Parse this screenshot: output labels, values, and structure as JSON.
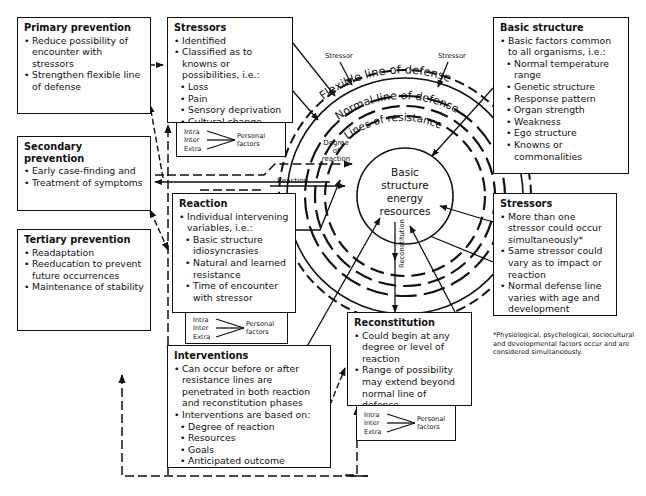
{
  "diagram": {
    "center": {
      "label_lines": [
        "Basic",
        "structure",
        "energy",
        "resources"
      ]
    },
    "rings": {
      "flexible": "Flexible line of defense",
      "normal": "Normal line of defense",
      "resistance": "Lines of resistance"
    },
    "labels": {
      "stressor_left": "Stressor",
      "stressor_right": "Stressor",
      "degree_of_reaction": [
        "Degree",
        "of",
        "reaction"
      ],
      "reaction": "Reaction",
      "reconstitution": "Reconstitution"
    }
  },
  "boxes": {
    "primary_prevention": {
      "title": "Primary prevention",
      "items": [
        "Reduce possibility of encounter with stressors",
        "Strengthen flexible line of defense"
      ]
    },
    "secondary_prevention": {
      "title": "Secondary prevention",
      "items": [
        "Early case-finding and",
        "Treatment of symptoms"
      ]
    },
    "tertiary_prevention": {
      "title": "Tertiary prevention",
      "items": [
        "Readaptation",
        "Reeducation to prevent future occurrences",
        "Maintenance of stability"
      ]
    },
    "stressors_top": {
      "title": "Stressors",
      "items": [
        "Identified",
        "Classified as to knowns or possibilities, i.e.:"
      ],
      "subitems": [
        "Loss",
        "Pain",
        "Sensory deprivation",
        "Cultural change"
      ]
    },
    "reaction": {
      "title": "Reaction",
      "items": [
        "Individual intervening variables, i.e.:"
      ],
      "subitems": [
        "Basic structure idiosyncrasies",
        "Natural and learned resistance",
        "Time of encounter with stressor"
      ]
    },
    "interventions": {
      "title": "Interventions",
      "items": [
        "Can occur before or after resistance lines are penetrated in both reaction and reconstitution phases",
        "Interventions are based on:"
      ],
      "subitems": [
        "Degree of reaction",
        "Resources",
        "Goals",
        "Anticipated outcome"
      ]
    },
    "basic_structure": {
      "title": "Basic structure",
      "items": [
        "Basic factors common to all organisms, i.e.:"
      ],
      "subitems": [
        "Normal temperature range",
        "Genetic structure",
        "Response pattern",
        "Organ strength",
        "Weakness",
        "Ego structure",
        "Knowns or commonalities"
      ]
    },
    "stressors_right": {
      "title": "Stressors",
      "items": [
        "More than one stressor could occur simultaneously*",
        "Same stressor could vary as to impact or reaction",
        "Normal defense line varies with age and development"
      ]
    },
    "reconstitution": {
      "title": "Reconstitution",
      "items": [
        "Could begin at any degree or level of reaction",
        "Range of possibility may extend beyond normal line of defense"
      ]
    }
  },
  "personal_factors": {
    "levels": [
      "Intra",
      "Inter",
      "Extra"
    ],
    "label_lines": [
      "Personal",
      "factors"
    ]
  },
  "footnote": "*Physiological, psychological, sociocultural and developmental factors occur and are considered simultaneously."
}
